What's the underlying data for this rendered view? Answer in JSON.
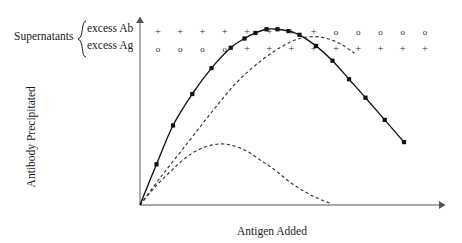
{
  "figure": {
    "width": 462,
    "height": 243,
    "background": "#ffffff"
  },
  "annotations": {
    "supernatants_label": "Supernatants",
    "brace_glyph": "{",
    "excess_ab_label": "excess Ab",
    "excess_ag_label": "excess Ag"
  },
  "axes": {
    "y_label": "Antibody Precipitated",
    "x_label": "Antigen Added",
    "axis_color": "#7a7a7a"
  },
  "symbol_rows": {
    "plus_glyph": "+",
    "circle_glyph": "o",
    "excess_ab_row": [
      "+",
      "+",
      "+",
      "+",
      "+",
      "+",
      "+",
      "+",
      "o",
      "o",
      "o",
      "o",
      "o"
    ],
    "excess_ag_row": [
      "o",
      "o",
      "o",
      "o",
      "+",
      "+",
      "+",
      "+",
      "+",
      "+",
      "+",
      "+",
      "+"
    ]
  },
  "chart_data": {
    "type": "line",
    "title": "",
    "xlabel": "Antigen Added",
    "ylabel": "Antibody Precipitated",
    "xlim": [
      0,
      100
    ],
    "ylim": [
      0,
      100
    ],
    "grid": false,
    "legend": "none",
    "axis_style": "arrow-headed, unlabeled qualitative axes",
    "series": [
      {
        "name": "Precipitin curve (measured)",
        "style": "solid",
        "marker": "filled-square",
        "color": "#111111",
        "x": [
          0,
          6,
          12,
          19,
          26,
          33,
          38,
          42,
          46,
          50,
          54,
          58,
          64,
          70,
          76,
          82,
          89,
          96
        ],
        "y": [
          0,
          22,
          43,
          60,
          74,
          85,
          90,
          93,
          95,
          95,
          94,
          92,
          86,
          78,
          68,
          58,
          46,
          34
        ]
      },
      {
        "name": "Antibody excess component (theoretical)",
        "style": "dashed",
        "marker": "none",
        "color": "#333333",
        "x": [
          0,
          8,
          17,
          26,
          35,
          44,
          52,
          58,
          63,
          68,
          73,
          78
        ],
        "y": [
          0,
          16,
          33,
          50,
          66,
          78,
          86,
          90,
          91,
          90,
          87,
          82
        ]
      },
      {
        "name": "Antigen excess component (theoretical)",
        "style": "dashed",
        "marker": "none",
        "color": "#333333",
        "x": [
          0,
          5,
          11,
          17,
          23,
          29,
          34,
          39,
          44,
          49,
          54,
          59,
          64,
          69
        ],
        "y": [
          0,
          9,
          18,
          26,
          31,
          33,
          32,
          29,
          24,
          19,
          13,
          8,
          4,
          1
        ]
      }
    ]
  }
}
